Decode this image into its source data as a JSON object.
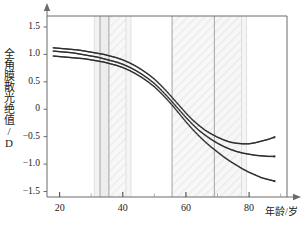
{
  "chart_data": {
    "type": "line",
    "title": "",
    "xlabel": "年龄/岁",
    "ylabel": "全角膜散光绝值/D",
    "xlim": [
      16,
      92
    ],
    "ylim": [
      -1.6,
      1.7
    ],
    "xticks": [
      20,
      40,
      60,
      80
    ],
    "xticklabels": [
      "20",
      "40",
      "60",
      "80"
    ],
    "yticks": [
      1.5,
      1.0,
      0.5,
      0,
      -0.5,
      -1.0,
      -1.5
    ],
    "yticklabels": [
      "1.5",
      "1.0",
      "0.5",
      "0",
      "−0.5",
      "−1.0",
      "−1.5"
    ],
    "grid": false,
    "legend": "none",
    "marker": "dotted-square",
    "series": [
      {
        "name": "upper",
        "color": "#2b2b2b",
        "x": [
          18,
          20,
          22,
          24,
          26,
          28,
          30,
          32,
          34,
          36,
          38,
          40,
          42,
          44,
          46,
          48,
          50,
          52,
          54,
          56,
          58,
          60,
          62,
          64,
          66,
          68,
          70,
          72,
          74,
          76,
          78,
          80,
          82,
          84,
          86,
          88
        ],
        "values": [
          1.12,
          1.11,
          1.1,
          1.09,
          1.08,
          1.06,
          1.04,
          1.02,
          1.0,
          0.97,
          0.94,
          0.9,
          0.85,
          0.79,
          0.72,
          0.64,
          0.55,
          0.44,
          0.32,
          0.19,
          0.06,
          -0.07,
          -0.19,
          -0.29,
          -0.38,
          -0.45,
          -0.51,
          -0.56,
          -0.6,
          -0.62,
          -0.63,
          -0.63,
          -0.61,
          -0.58,
          -0.55,
          -0.51
        ]
      },
      {
        "name": "middle",
        "color": "#2b2b2b",
        "x": [
          18,
          20,
          22,
          24,
          26,
          28,
          30,
          32,
          34,
          36,
          38,
          40,
          42,
          44,
          46,
          48,
          50,
          52,
          54,
          56,
          58,
          60,
          62,
          64,
          66,
          68,
          70,
          72,
          74,
          76,
          78,
          80,
          82,
          84,
          86,
          88
        ],
        "values": [
          1.06,
          1.05,
          1.04,
          1.03,
          1.01,
          0.99,
          0.97,
          0.95,
          0.92,
          0.89,
          0.86,
          0.82,
          0.77,
          0.71,
          0.64,
          0.56,
          0.47,
          0.36,
          0.24,
          0.11,
          -0.02,
          -0.15,
          -0.27,
          -0.38,
          -0.47,
          -0.55,
          -0.62,
          -0.68,
          -0.73,
          -0.77,
          -0.8,
          -0.82,
          -0.84,
          -0.85,
          -0.86,
          -0.86
        ]
      },
      {
        "name": "lower",
        "color": "#2b2b2b",
        "x": [
          18,
          20,
          22,
          24,
          26,
          28,
          30,
          32,
          34,
          36,
          38,
          40,
          42,
          44,
          46,
          48,
          50,
          52,
          54,
          56,
          58,
          60,
          62,
          64,
          66,
          68,
          70,
          72,
          74,
          76,
          78,
          80,
          82,
          84,
          86,
          88
        ],
        "values": [
          0.97,
          0.96,
          0.95,
          0.94,
          0.93,
          0.92,
          0.9,
          0.88,
          0.86,
          0.83,
          0.8,
          0.76,
          0.71,
          0.65,
          0.58,
          0.5,
          0.41,
          0.3,
          0.18,
          0.05,
          -0.09,
          -0.23,
          -0.36,
          -0.48,
          -0.59,
          -0.69,
          -0.78,
          -0.87,
          -0.95,
          -1.02,
          -1.09,
          -1.15,
          -1.2,
          -1.25,
          -1.28,
          -1.31
        ]
      }
    ],
    "shaded_bands": [
      {
        "name": "band-a",
        "x0": 31.0,
        "x1": 32.8,
        "fill": "#f2f2f2",
        "hatch": false
      },
      {
        "name": "band-b",
        "x0": 32.8,
        "x1": 35.6,
        "fill": "#ededed",
        "hatch": false
      },
      {
        "name": "band-c",
        "x0": 35.6,
        "x1": 41.0,
        "fill": "#f0f0f0",
        "hatch": true
      },
      {
        "name": "band-d",
        "x0": 41.0,
        "x1": 42.6,
        "fill": "#f5f5f5",
        "hatch": false
      },
      {
        "name": "band-e",
        "x0": 55.6,
        "x1": 69.0,
        "fill": "#efefef",
        "hatch": true
      },
      {
        "name": "band-f",
        "x0": 69.0,
        "x1": 77.6,
        "fill": "#ededed",
        "hatch": true
      },
      {
        "name": "band-g",
        "x0": 77.6,
        "x1": 79.2,
        "fill": "#f5f5f5",
        "hatch": false
      }
    ],
    "band_edges": [
      31.0,
      32.8,
      35.6,
      41.0,
      42.6,
      55.6,
      69.0,
      77.6,
      79.2
    ],
    "axis_arrows": {
      "x": true,
      "y": true
    },
    "axis_color": "#6b6b6b"
  }
}
